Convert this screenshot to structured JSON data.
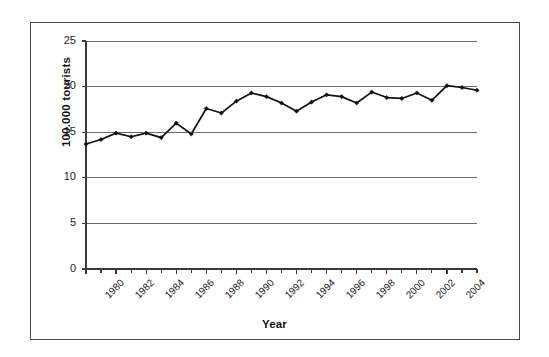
{
  "chart_data": {
    "type": "line",
    "title": "",
    "xlabel": "Year",
    "ylabel": "100.000 tourists",
    "ylim": [
      0,
      25
    ],
    "xlim": [
      1980,
      2006
    ],
    "yticks": [
      0,
      5,
      10,
      15,
      20,
      25
    ],
    "ytick_labels": [
      "0",
      "5",
      "10",
      "15",
      "20",
      "25"
    ],
    "xticks": [
      1980,
      1982,
      1984,
      1986,
      1988,
      1990,
      1992,
      1994,
      1996,
      1998,
      2000,
      2002,
      2004
    ],
    "xtick_labels": [
      "1980",
      "1982",
      "1984",
      "1986",
      "1988",
      "1990",
      "1992",
      "1994",
      "1996",
      "1998",
      "2000",
      "2002",
      "2004"
    ],
    "grid": true,
    "grid_axis": "y",
    "legend": false,
    "legend_position": "none",
    "marker": "diamond",
    "line_color": "#111111",
    "x": [
      1980,
      1981,
      1982,
      1983,
      1984,
      1985,
      1986,
      1987,
      1988,
      1989,
      1990,
      1991,
      1992,
      1993,
      1994,
      1995,
      1996,
      1997,
      1998,
      1999,
      2000,
      2001,
      2002,
      2003,
      2004,
      2005,
      2006
    ],
    "values": [
      13.7,
      14.2,
      14.9,
      14.5,
      14.9,
      14.4,
      16.0,
      14.8,
      17.6,
      17.1,
      18.4,
      19.3,
      18.9,
      18.2,
      17.3,
      18.3,
      19.1,
      18.9,
      18.2,
      19.4,
      18.8,
      18.7,
      19.3,
      18.5,
      20.1,
      19.9,
      19.6
    ],
    "series": [
      {
        "name": "tourists",
        "values": [
          13.7,
          14.2,
          14.9,
          14.5,
          14.9,
          14.4,
          16.0,
          14.8,
          17.6,
          17.1,
          18.4,
          19.3,
          18.9,
          18.2,
          17.3,
          18.3,
          19.1,
          18.9,
          18.2,
          19.4,
          18.8,
          18.7,
          19.3,
          18.5,
          20.1,
          19.9,
          19.6
        ]
      }
    ]
  },
  "figure": {
    "y_axis_title": "100.000 tourists",
    "x_axis_title": "Year"
  },
  "colors": {
    "line": "#111111",
    "grid": "#6b6b6b",
    "axis": "#3b3b3b",
    "frame": "#4a4a4a",
    "background": "#ffffff"
  }
}
